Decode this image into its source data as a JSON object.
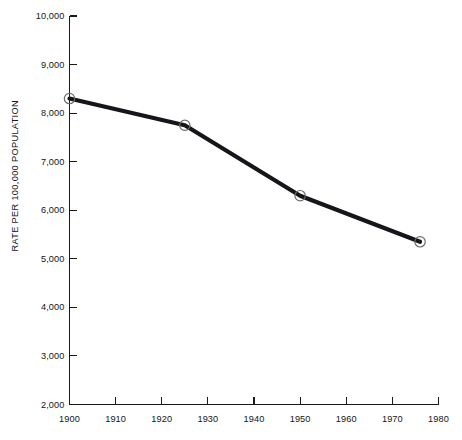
{
  "chart_data": {
    "type": "line",
    "title": "",
    "xlabel": "",
    "ylabel": "RATE PER 100,000 POPULATION",
    "xlim": [
      1900,
      1980
    ],
    "ylim": [
      2000,
      10000
    ],
    "grid": false,
    "legend": "none",
    "x_ticks": [
      1900,
      1910,
      1920,
      1930,
      1940,
      1950,
      1960,
      1970,
      1980
    ],
    "x_tick_labels": [
      "1900",
      "1910",
      "1920",
      "1930",
      "1940",
      "1950",
      "1960",
      "1970",
      "1980"
    ],
    "y_ticks": [
      2000,
      3000,
      4000,
      5000,
      6000,
      7000,
      8000,
      9000,
      10000
    ],
    "y_tick_labels": [
      "2,000",
      "3,000",
      "4,000",
      "5,000",
      "6,000",
      "7,000",
      "8,000",
      "9,000",
      "10,000"
    ],
    "series": [
      {
        "name": "rate",
        "marker": "open-circle",
        "color": "#15161a",
        "points": [
          {
            "x": 1900,
            "y": 8300
          },
          {
            "x": 1925,
            "y": 7750
          },
          {
            "x": 1950,
            "y": 6300
          },
          {
            "x": 1976,
            "y": 5350
          }
        ]
      }
    ]
  },
  "colors": {
    "line": "#15161a",
    "axis": "#1a1a1a",
    "marker_stroke": "#6b6b6b",
    "background": "#ffffff",
    "text": "#151515"
  }
}
